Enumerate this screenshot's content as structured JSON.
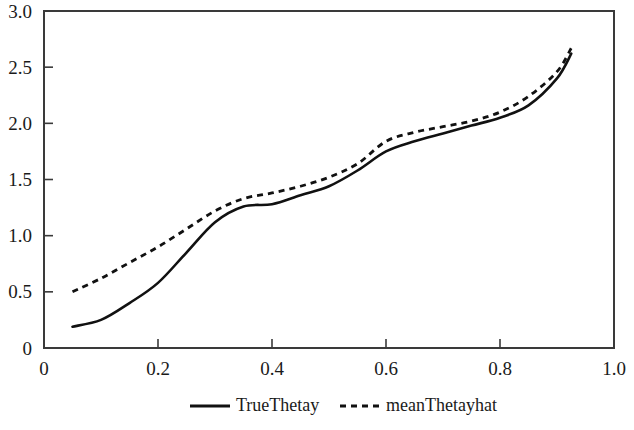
{
  "chart_data": {
    "type": "line",
    "title": "",
    "subtitle": "",
    "xlabel": "",
    "ylabel": "",
    "xlim": [
      0,
      1.0
    ],
    "ylim": [
      0,
      3.0
    ],
    "grid": false,
    "legend_position": "bottom",
    "x_ticks": [
      "0",
      "0.2",
      "0.4",
      "0.6",
      "0.8",
      "1.0"
    ],
    "x_tick_values": [
      0,
      0.2,
      0.4,
      0.6,
      0.8,
      1.0
    ],
    "y_ticks": [
      "0",
      "0.5",
      "1.0",
      "1.5",
      "2.0",
      "2.5",
      "3.0"
    ],
    "y_tick_values": [
      0,
      0.5,
      1.0,
      1.5,
      2.0,
      2.5,
      3.0
    ],
    "x": [
      0.05,
      0.1,
      0.15,
      0.2,
      0.25,
      0.3,
      0.35,
      0.4,
      0.45,
      0.5,
      0.55,
      0.6,
      0.65,
      0.7,
      0.75,
      0.8,
      0.85,
      0.9,
      0.925
    ],
    "series": [
      {
        "name": "TrueThetay",
        "style": "solid",
        "color": "#111111",
        "values": [
          0.19,
          0.25,
          0.4,
          0.58,
          0.85,
          1.12,
          1.26,
          1.28,
          1.36,
          1.44,
          1.58,
          1.75,
          1.84,
          1.91,
          1.98,
          2.05,
          2.16,
          2.4,
          2.62
        ]
      },
      {
        "name": "meanThetayhat",
        "style": "dashed",
        "color": "#111111",
        "values": [
          0.5,
          0.62,
          0.76,
          0.9,
          1.06,
          1.22,
          1.33,
          1.38,
          1.44,
          1.52,
          1.64,
          1.84,
          1.92,
          1.97,
          2.02,
          2.1,
          2.24,
          2.46,
          2.67
        ]
      }
    ]
  },
  "legend": {
    "items": [
      {
        "label": "TrueThetay",
        "style": "solid"
      },
      {
        "label": "meanThetayhat",
        "style": "dashed"
      }
    ]
  }
}
